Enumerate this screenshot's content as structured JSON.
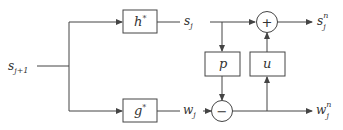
{
  "diagram": {
    "type": "lifting-scheme-block-diagram",
    "input": {
      "label": "s",
      "sub": "j+1"
    },
    "filters": {
      "h": {
        "label": "h",
        "sup": "*"
      },
      "g": {
        "label": "g",
        "sup": "*"
      }
    },
    "intermediate": {
      "s": {
        "label": "s",
        "sub": "j"
      },
      "w": {
        "label": "w",
        "sub": "j"
      }
    },
    "operators": {
      "predict": {
        "label": "p"
      },
      "update": {
        "label": "u"
      },
      "add": {
        "symbol": "+"
      },
      "subtract": {
        "symbol": "−"
      }
    },
    "outputs": {
      "s": {
        "label": "s",
        "sub": "j",
        "sup": "n"
      },
      "w": {
        "label": "w",
        "sub": "j",
        "sup": "n"
      }
    }
  },
  "colors": {
    "stroke": "#444444",
    "text": "#333333",
    "background": "#ffffff"
  }
}
